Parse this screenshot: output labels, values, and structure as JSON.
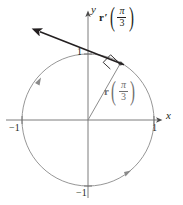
{
  "figure": {
    "kind": "unit-circle-vector-diagram",
    "background_color": "#ffffff",
    "axes": {
      "x_label": "x",
      "y_label": "y",
      "axis_color": "#6e6e6e",
      "ticks": {
        "x_positive": "1",
        "x_negative": "−1",
        "y_positive": "1",
        "y_negative": "−1"
      }
    },
    "circle": {
      "center": [
        88,
        120
      ],
      "radius": 66,
      "stroke_color": "#6e6e6e",
      "orientation": "counterclockwise",
      "direction_arrow_count": 2
    },
    "vectors": [
      {
        "id": "position-vector",
        "symbol": "r",
        "prime": "",
        "argument_numerator": "π",
        "argument_denominator": "3",
        "color": "#8c8c8c",
        "from": [
          88,
          120
        ],
        "to": [
          121,
          63
        ],
        "label_position": [
          106,
          80
        ]
      },
      {
        "id": "velocity-vector",
        "symbol": "r",
        "prime": "′",
        "argument_numerator": "π",
        "argument_denominator": "3",
        "color": "#231f20",
        "from": [
          121,
          63
        ],
        "to": [
          39,
          31
        ],
        "label_position": [
          100,
          6
        ]
      }
    ],
    "right_angle_marker": {
      "present": true,
      "at": [
        113,
        64
      ],
      "color": "#231f20"
    }
  }
}
